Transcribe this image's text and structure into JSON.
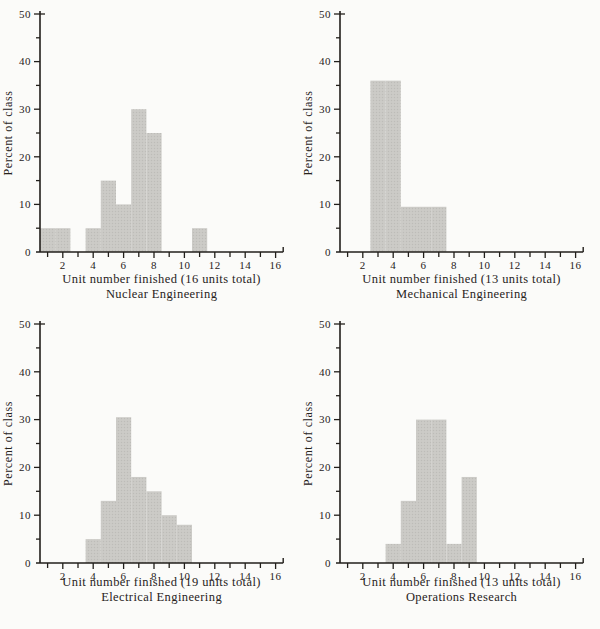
{
  "colors": {
    "background": "#fbfbf9",
    "bar_fill": "#cccbc7",
    "bar_dot": "#bdbcb8",
    "axis": "#221f1b",
    "text": "#27221b"
  },
  "chart_data": [
    {
      "type": "bar",
      "title": "Nuclear Engineering",
      "xlabel": "Unit number finished (16 units total)",
      "ylabel": "Percent of class",
      "xlim": [
        0.5,
        16.5
      ],
      "ylim": [
        0,
        50
      ],
      "grid": false,
      "legend": "none",
      "x_tick_labels": [
        "2",
        "4",
        "6",
        "8",
        "10",
        "12",
        "14",
        "16"
      ],
      "y_tick_labels": [
        "0",
        "10",
        "20",
        "30",
        "40",
        "50"
      ],
      "bar_width": 1,
      "x": [
        1,
        2,
        4,
        5,
        6,
        7,
        8,
        11
      ],
      "values": [
        5,
        5,
        5,
        15,
        10,
        30,
        25,
        5
      ]
    },
    {
      "type": "bar",
      "title": "Mechanical Engineering",
      "xlabel": "Unit number finished (13 units total)",
      "ylabel": "Percent of class",
      "xlim": [
        0.5,
        16.5
      ],
      "ylim": [
        0,
        50
      ],
      "grid": false,
      "legend": "none",
      "x_tick_labels": [
        "2",
        "4",
        "6",
        "8",
        "10",
        "12",
        "14",
        "16"
      ],
      "y_tick_labels": [
        "0",
        "10",
        "20",
        "30",
        "40",
        "50"
      ],
      "bar_width": 1,
      "x": [
        3,
        4,
        5,
        6,
        7
      ],
      "values": [
        36,
        36,
        9.5,
        9.5,
        9.5
      ]
    },
    {
      "type": "bar",
      "title": "Electrical Engineering",
      "xlabel": "Unit number finished (19 units total)",
      "ylabel": "Percent of class",
      "xlim": [
        0.5,
        16.5
      ],
      "ylim": [
        0,
        50
      ],
      "grid": false,
      "legend": "none",
      "x_tick_labels": [
        "2",
        "4",
        "6",
        "8",
        "10",
        "12",
        "14",
        "16"
      ],
      "y_tick_labels": [
        "0",
        "10",
        "20",
        "30",
        "40",
        "50"
      ],
      "bar_width": 1,
      "x": [
        4,
        5,
        6,
        7,
        8,
        9,
        10
      ],
      "values": [
        5,
        13,
        30.5,
        18,
        15,
        10,
        8
      ]
    },
    {
      "type": "bar",
      "title": "Operations Research",
      "xlabel": "Unit number finished (13 units total)",
      "ylabel": "Percent of class",
      "xlim": [
        0.5,
        16.5
      ],
      "ylim": [
        0,
        50
      ],
      "grid": false,
      "legend": "none",
      "x_tick_labels": [
        "2",
        "4",
        "6",
        "8",
        "10",
        "12",
        "14",
        "16"
      ],
      "y_tick_labels": [
        "0",
        "10",
        "20",
        "30",
        "40",
        "50"
      ],
      "bar_width": 1,
      "x": [
        4,
        5,
        6,
        7,
        8,
        9
      ],
      "values": [
        4,
        13,
        30,
        30,
        4,
        18
      ]
    }
  ]
}
